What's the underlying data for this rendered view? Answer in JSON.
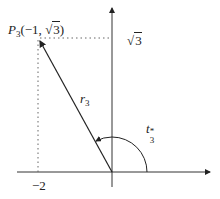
{
  "diagram": {
    "point_label": {
      "name": "P",
      "subscript": "3",
      "coords": "(−1, ",
      "coord_end": ")",
      "sqrt_arg": "3",
      "radical": "√"
    },
    "y_tick": {
      "radical": "√",
      "arg": "3"
    },
    "x_tick": "−2",
    "vector_label": {
      "name": "r",
      "subscript": "3"
    },
    "angle_label": {
      "name": "t",
      "subscript": "3",
      "superscript": "*"
    },
    "colors": {
      "ink": "#222222",
      "dotted": "#555555"
    }
  }
}
